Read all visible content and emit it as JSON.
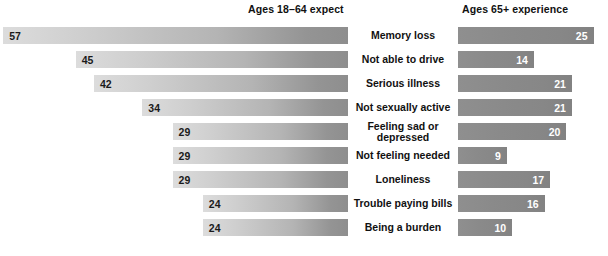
{
  "header": {
    "left_title": "Ages 18–64 expect",
    "right_title": "Ages 65+ experience"
  },
  "chart_data": {
    "type": "bar",
    "title": "",
    "xlabel": "",
    "ylabel": "",
    "orientation": "horizontal",
    "layout": "diverging-paired",
    "grid": false,
    "legend_position": "top",
    "value_unit": "percent",
    "categories": [
      "Memory loss",
      "Not able to drive",
      "Serious illness",
      "Not sexually active",
      "Feeling sad or depressed",
      "Not feeling needed",
      "Loneliness",
      "Trouble paying bills",
      "Being a burden"
    ],
    "series": [
      {
        "name": "Ages 18–64 expect",
        "side": "left",
        "values": [
          57,
          45,
          42,
          34,
          29,
          29,
          29,
          24,
          24
        ]
      },
      {
        "name": "Ages 65+ experience",
        "side": "right",
        "values": [
          25,
          14,
          21,
          21,
          20,
          9,
          17,
          16,
          10
        ]
      }
    ]
  },
  "rows": [
    {
      "label": "Memory loss",
      "label_line1": "Memory loss",
      "label_line2": "",
      "left_value": "57",
      "right_value": "25"
    },
    {
      "label": "Not able to drive",
      "label_line1": "Not able to drive",
      "label_line2": "",
      "left_value": "45",
      "right_value": "14"
    },
    {
      "label": "Serious illness",
      "label_line1": "Serious illness",
      "label_line2": "",
      "left_value": "42",
      "right_value": "21"
    },
    {
      "label": "Not sexually active",
      "label_line1": "Not sexually active",
      "label_line2": "",
      "left_value": "34",
      "right_value": "21"
    },
    {
      "label": "Feeling sad or depressed",
      "label_line1": "Feeling sad or",
      "label_line2": "depressed",
      "left_value": "29",
      "right_value": "20"
    },
    {
      "label": "Not feeling needed",
      "label_line1": "Not feeling needed",
      "label_line2": "",
      "left_value": "29",
      "right_value": "9"
    },
    {
      "label": "Loneliness",
      "label_line1": "Loneliness",
      "label_line2": "",
      "left_value": "29",
      "right_value": "17"
    },
    {
      "label": "Trouble paying bills",
      "label_line1": "Trouble paying bills",
      "label_line2": "",
      "left_value": "24",
      "right_value": "16"
    },
    {
      "label": "Being a burden",
      "label_line1": "Being a burden",
      "label_line2": "",
      "left_value": "24",
      "right_value": "10"
    }
  ],
  "colors": {
    "left_bar_light": "#dcdcdc",
    "left_bar_dark": "#8e8e8e",
    "right_bar": "#8a8a8a",
    "text": "#111111",
    "right_value_text": "#ffffff",
    "background": "#ffffff"
  }
}
